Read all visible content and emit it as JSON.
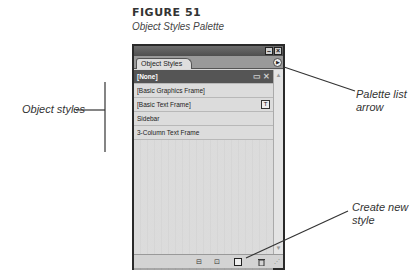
{
  "figure": {
    "label": "FIGURE 51",
    "caption": "Object Styles Palette"
  },
  "palette": {
    "tab_label": "Object Styles",
    "minimize_icon": "minimize-icon",
    "close_icon": "close-icon",
    "menu_arrow_icon": "palette-menu-arrow-icon",
    "styles": [
      {
        "label": "[None]",
        "selected": true,
        "icons": [
          "frame-icon",
          "no-edit-icon"
        ]
      },
      {
        "label": "[Basic Graphics Frame]",
        "selected": false
      },
      {
        "label": "[Basic Text Frame]",
        "selected": false,
        "icons": [
          "default-text-frame-icon"
        ]
      },
      {
        "label": "Sidebar",
        "selected": false
      },
      {
        "label": "3-Column Text Frame",
        "selected": false
      }
    ],
    "bottom_buttons": [
      {
        "name": "clear-overrides-button",
        "icon": "clear-overrides-icon"
      },
      {
        "name": "clear-attributes-button",
        "icon": "clear-attributes-icon"
      },
      {
        "name": "create-new-style-button",
        "icon": "new-style-icon"
      },
      {
        "name": "delete-style-button",
        "icon": "trash-icon"
      }
    ]
  },
  "callouts": {
    "object_styles": "Object styles",
    "palette_list_arrow_line1": "Palette list",
    "palette_list_arrow_line2": "arrow",
    "create_new_style_line1": "Create new",
    "create_new_style_line2": "style"
  },
  "glyphs": {
    "minimize": "–",
    "close": "×",
    "menu_arrow": "▶",
    "frame": "▭",
    "no_edit": "✕",
    "text_frame": "T",
    "scroll_up": "▲",
    "scroll_down": "▼",
    "clear_overrides": "⊟",
    "clear_attributes": "⊡",
    "new_style": "",
    "delete": "🗑",
    "grip": "⋰"
  }
}
